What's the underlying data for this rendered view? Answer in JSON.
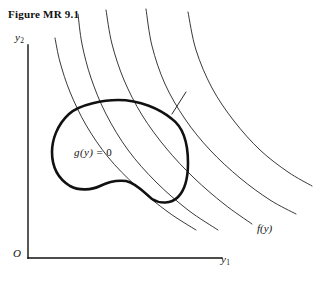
{
  "figure": {
    "title": "Figure MR 9.1",
    "background_color": "#ffffff",
    "ink_color": "#111111"
  },
  "axes": {
    "y_axis_label": "y",
    "y_axis_subscript": "2",
    "x_axis_label": "y",
    "x_axis_subscript": "1",
    "origin_label": "O",
    "axis_color": "#111111"
  },
  "annotations": {
    "constraint_label_fn": "g",
    "constraint_label_arg": "(y)",
    "constraint_label_eq": "=",
    "constraint_label_value": "0",
    "objective_label_fn": "f",
    "objective_label_arg": "(y)"
  },
  "chart_data": {
    "type": "line",
    "title": "Figure MR 9.1",
    "xlabel": "y1",
    "ylabel": "y2",
    "grid": false,
    "legend": null,
    "series": [
      {
        "name": "constraint-boundary",
        "role": "closed-region-boundary",
        "stroke_width": 2.6,
        "closed": true,
        "points": [
          [
            118,
            100
          ],
          [
            92,
            103
          ],
          [
            69,
            114
          ],
          [
            55,
            133
          ],
          [
            52,
            152
          ],
          [
            57,
            173
          ],
          [
            70,
            186
          ],
          [
            86,
            190
          ],
          [
            100,
            186
          ],
          [
            112,
            181
          ],
          [
            126,
            181
          ],
          [
            140,
            190
          ],
          [
            152,
            199
          ],
          [
            166,
            203
          ],
          [
            178,
            197
          ],
          [
            186,
            183
          ],
          [
            188,
            163
          ],
          [
            184,
            141
          ],
          [
            172,
            119
          ],
          [
            152,
            105
          ],
          [
            134,
            100
          ],
          [
            118,
            100
          ]
        ]
      },
      {
        "name": "level-curve-1",
        "role": "objective-contour",
        "stroke_width": 0.9,
        "closed": false,
        "points": [
          [
            55,
            38
          ],
          [
            60,
            62
          ],
          [
            70,
            92
          ],
          [
            86,
            125
          ],
          [
            108,
            157
          ],
          [
            136,
            186
          ],
          [
            168,
            212
          ],
          [
            196,
            230
          ]
        ]
      },
      {
        "name": "level-curve-2",
        "role": "objective-contour",
        "stroke_width": 0.9,
        "closed": false,
        "points": [
          [
            78,
            14
          ],
          [
            82,
            44
          ],
          [
            91,
            78
          ],
          [
            106,
            114
          ],
          [
            128,
            150
          ],
          [
            156,
            182
          ],
          [
            188,
            210
          ],
          [
            218,
            230
          ]
        ]
      },
      {
        "name": "level-curve-3",
        "role": "objective-contour-tangent",
        "stroke_width": 0.9,
        "closed": false,
        "points": [
          [
            106,
            10
          ],
          [
            112,
            44
          ],
          [
            124,
            80
          ],
          [
            142,
            115
          ],
          [
            166,
            148
          ],
          [
            194,
            178
          ],
          [
            224,
            204
          ],
          [
            252,
            224
          ]
        ]
      },
      {
        "name": "level-curve-4",
        "role": "objective-contour",
        "stroke_width": 0.9,
        "closed": false,
        "points": [
          [
            146,
            9
          ],
          [
            152,
            46
          ],
          [
            165,
            84
          ],
          [
            185,
            119
          ],
          [
            210,
            150
          ],
          [
            240,
            178
          ],
          [
            270,
            200
          ],
          [
            296,
            214
          ]
        ]
      },
      {
        "name": "level-curve-5",
        "role": "objective-contour",
        "stroke_width": 0.9,
        "closed": false,
        "points": [
          [
            188,
            12
          ],
          [
            196,
            50
          ],
          [
            212,
            88
          ],
          [
            234,
            121
          ],
          [
            260,
            150
          ],
          [
            288,
            172
          ],
          [
            312,
            186
          ]
        ]
      }
    ],
    "pointer": {
      "name": "tangency-pointer",
      "from": [
        172,
        114
      ],
      "to": [
        186,
        92
      ],
      "stroke_width": 0.9
    },
    "axis_lines": {
      "y_axis": [
        [
          28,
          45
        ],
        [
          28,
          258
        ]
      ],
      "x_axis": [
        [
          28,
          258
        ],
        [
          222,
          258
        ]
      ]
    }
  }
}
